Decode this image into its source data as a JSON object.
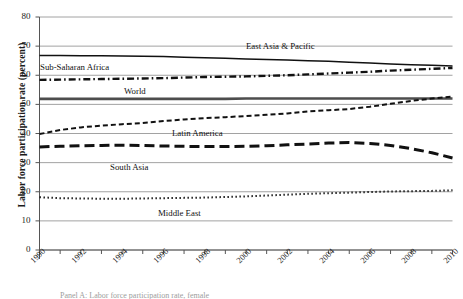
{
  "figure": {
    "background": "#ffffff",
    "caption_partial": "Panel A: Labor force participation rate, female"
  },
  "axes": {
    "y_title": "Labor force participation rate (percent)",
    "y_ticks": [
      0,
      10,
      20,
      30,
      40,
      50,
      60,
      70,
      80
    ],
    "y_tick_labels": [
      "0",
      "10",
      "20",
      "30",
      "40",
      "50",
      "60",
      "70",
      "80"
    ],
    "x_tick_labels": [
      "1990",
      "1992",
      "1994",
      "1996",
      "1998",
      "2000",
      "2002",
      "2004",
      "2006",
      "2008",
      "2010"
    ],
    "x_label": "",
    "grid": "horizontal"
  },
  "series_labels": {
    "east_asia": "East Asia & Pacific",
    "sub_saharan": "Sub-Saharan Africa",
    "world": "World",
    "latin_america": "Latin America",
    "south_asia": "South Asia",
    "middle_east": "Middle East"
  },
  "colors": {
    "line": "#111111",
    "world_line": "#4d4d4d",
    "grid": "#8a8a8a",
    "axis": "#555555",
    "text": "#1b1b1b"
  },
  "chart_data": {
    "type": "line",
    "title": "",
    "xlabel": "",
    "ylabel": "Labor force participation rate (percent)",
    "xlim": [
      1990,
      2010
    ],
    "ylim": [
      0,
      80
    ],
    "grid": true,
    "legend": "inline-annotations",
    "x": [
      1990,
      1991,
      1992,
      1993,
      1994,
      1995,
      1996,
      1997,
      1998,
      1999,
      2000,
      2001,
      2002,
      2003,
      2004,
      2005,
      2006,
      2007,
      2008,
      2009,
      2010
    ],
    "series": [
      {
        "name": "East Asia & Pacific",
        "style": "solid",
        "values": [
          66.8,
          66.8,
          66.7,
          66.7,
          66.6,
          66.5,
          66.4,
          66.2,
          66.0,
          65.8,
          65.6,
          65.4,
          65.2,
          65.0,
          64.8,
          64.5,
          64.2,
          63.9,
          63.6,
          63.4,
          63.2
        ]
      },
      {
        "name": "Sub-Saharan Africa",
        "style": "dash-dot",
        "values": [
          58.4,
          58.5,
          58.6,
          58.7,
          58.8,
          58.9,
          59.0,
          59.2,
          59.4,
          59.5,
          59.6,
          59.8,
          60.0,
          60.3,
          60.6,
          60.9,
          61.2,
          61.6,
          61.9,
          62.2,
          62.5
        ]
      },
      {
        "name": "World",
        "style": "solid-thick",
        "values": [
          51.9,
          51.9,
          51.9,
          51.9,
          51.9,
          51.9,
          51.9,
          51.9,
          51.9,
          51.9,
          52.0,
          52.0,
          52.0,
          52.0,
          52.0,
          52.0,
          52.0,
          52.0,
          52.0,
          52.0,
          52.0
        ]
      },
      {
        "name": "Latin America",
        "style": "dashed-small",
        "values": [
          39.8,
          41.2,
          42.1,
          42.7,
          43.2,
          43.6,
          44.3,
          44.8,
          45.3,
          45.6,
          46.0,
          46.4,
          46.9,
          47.6,
          48.0,
          48.4,
          49.2,
          50.2,
          51.2,
          52.0,
          52.7
        ]
      },
      {
        "name": "South Asia",
        "style": "dashed-long",
        "values": [
          35.4,
          35.6,
          35.8,
          35.9,
          36.0,
          35.9,
          35.7,
          35.6,
          35.5,
          35.5,
          35.6,
          35.8,
          36.1,
          36.4,
          36.7,
          36.9,
          36.6,
          35.9,
          34.8,
          33.4,
          31.6
        ]
      },
      {
        "name": "Middle East",
        "style": "dotted",
        "values": [
          18.1,
          17.8,
          17.7,
          17.6,
          17.6,
          17.7,
          17.8,
          17.9,
          18.0,
          18.2,
          18.4,
          18.7,
          19.0,
          19.3,
          19.5,
          19.7,
          19.9,
          20.1,
          20.2,
          20.3,
          20.5
        ]
      }
    ]
  }
}
